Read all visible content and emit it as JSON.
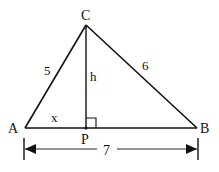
{
  "diagram": {
    "vertices": {
      "A": {
        "label": "A",
        "x": 25,
        "y": 128
      },
      "B": {
        "label": "B",
        "x": 197,
        "y": 128
      },
      "C": {
        "label": "C",
        "x": 86,
        "y": 25
      },
      "P": {
        "label": "P",
        "x": 86,
        "y": 128
      }
    },
    "labels": {
      "side_AC": "5",
      "side_BC": "6",
      "side_AB": "7",
      "altitude": "h",
      "segment_AP": "x",
      "vertex_A": "A",
      "vertex_B": "B",
      "vertex_C": "C",
      "foot_P": "P"
    },
    "colors": {
      "stroke": "#111111",
      "background": "#ffffff"
    }
  }
}
